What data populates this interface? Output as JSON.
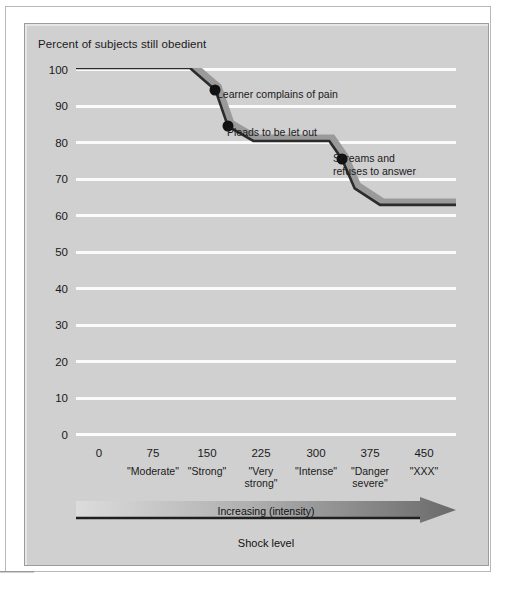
{
  "figure": {
    "title": "Percent of subjects still obedient",
    "axis_caption": "Increasing (intensity)",
    "shock_label": "Shock level"
  },
  "chart_data": {
    "type": "line",
    "title": "Percent of subjects still obedient",
    "xlabel": "Shock level",
    "ylabel": "Percent of subjects still obedient",
    "xlim": [
      0,
      450
    ],
    "ylim": [
      0,
      100
    ],
    "grid": true,
    "legend": "none",
    "x_ticks": [
      0,
      75,
      150,
      225,
      300,
      375,
      450
    ],
    "x_tick_labels": [
      "0",
      "75",
      "150",
      "225",
      "300",
      "375",
      "450"
    ],
    "x_tick_words": [
      "",
      "\"Moderate\"",
      "\"Strong\"",
      "\"Very\nstrong\"",
      "\"Intense\"",
      "\"Danger\nsevere\"",
      "\"XXX\""
    ],
    "y_ticks": [
      0,
      10,
      20,
      30,
      40,
      50,
      60,
      70,
      80,
      90,
      100
    ],
    "series": [
      {
        "name": "Percent still obedient",
        "x": [
          0,
          135,
          165,
          180,
          210,
          300,
          315,
          330,
          360,
          450
        ],
        "values": [
          100,
          100,
          94,
          84,
          80,
          80,
          75,
          67,
          62.5,
          62.5
        ]
      }
    ],
    "points": [
      {
        "label": "Learner complains of pain",
        "x": 165,
        "y": 94
      },
      {
        "label": "Pleads to be let out",
        "x": 180,
        "y": 84
      },
      {
        "label": "Screams and\nrefuses to answer",
        "x": 315,
        "y": 75
      }
    ],
    "colors": {
      "plot_background": "#d0d0d0",
      "gridline": "#fbfbfb",
      "line": "#2b2b2b",
      "line_shadow": "#9a9a9a",
      "point": "#111111",
      "arrow_start": "#d8d8d8",
      "arrow_end": "#6a6a6a"
    }
  },
  "annotations": [
    {
      "text": "Learner complains of pain"
    },
    {
      "text": "Pleads to be let out"
    },
    {
      "text": "Screams and"
    },
    {
      "text": "refuses to answer"
    }
  ]
}
